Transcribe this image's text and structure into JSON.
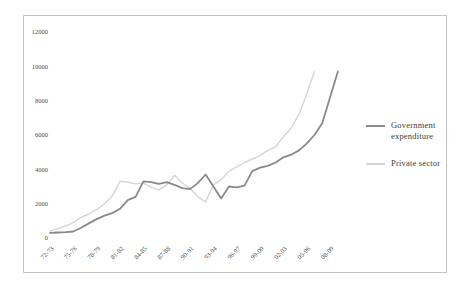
{
  "chart_data": {
    "type": "line",
    "title": "",
    "xlabel": "",
    "ylabel": "",
    "grid": false,
    "legend_position": "right",
    "ylim": [
      0,
      12000
    ],
    "y_ticks": [
      0,
      2000,
      4000,
      6000,
      8000,
      10000,
      12000
    ],
    "x_tick_labels": [
      "72-73",
      "75-76",
      "78-79",
      "81-82",
      "84-85",
      "87-88",
      "90-91",
      "93-94",
      "96-97",
      "99-00",
      "02-03",
      "05-06",
      "08-09"
    ],
    "points_per_tick": 3,
    "series": [
      {
        "name": "Government expenditure",
        "color": "#8a8a8a",
        "stroke_width": 1.8,
        "values": [
          300,
          320,
          340,
          380,
          600,
          850,
          1100,
          1300,
          1450,
          1700,
          2200,
          2400,
          3300,
          3250,
          3150,
          3250,
          3100,
          2900,
          2850,
          3200,
          3700,
          3000,
          2300,
          3000,
          2950,
          3050,
          3900,
          4100,
          4200,
          4400,
          4700,
          4850,
          5100,
          5500,
          6000,
          6700,
          8200,
          9700
        ]
      },
      {
        "name": "Private sector",
        "color": "#d6d6d6",
        "stroke_width": 1.4,
        "values": [
          400,
          550,
          700,
          900,
          1200,
          1400,
          1650,
          2000,
          2450,
          3300,
          3250,
          3150,
          3200,
          2950,
          2800,
          3100,
          3650,
          3200,
          2900,
          2400,
          2100,
          3100,
          3400,
          3900,
          4150,
          4400,
          4600,
          4800,
          5100,
          5300,
          5900,
          6400,
          7200,
          8400,
          9700
        ]
      }
    ]
  },
  "colors": {
    "frame_border": "#c4c4c4",
    "background": "#ffffff",
    "tick_text": "#4a4a4a"
  }
}
